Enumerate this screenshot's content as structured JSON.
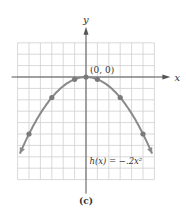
{
  "chart_data": {
    "type": "line",
    "title": "",
    "caption": "(c)",
    "xlabel": "x",
    "ylabel": "y",
    "xlim": [
      -6,
      6
    ],
    "ylim": [
      -9,
      3
    ],
    "grid": true,
    "function_label": "h(x) = −.2x²",
    "origin_label": "(0, 0)",
    "series": [
      {
        "name": "h(x) = -.2x^2",
        "x": [
          -5,
          -3,
          -1,
          0,
          1,
          3,
          5
        ],
        "y": [
          -5,
          -1.8,
          -0.2,
          0,
          -0.2,
          -1.8,
          -5
        ],
        "marked_points": true
      }
    ],
    "curve_extent_x": [
      -5.8,
      5.8
    ]
  },
  "colors": {
    "grid": "#cfcfcf",
    "axis": "#555555",
    "curve": "#8a8a8a",
    "point": "#7a7a7a",
    "text": "#333333"
  }
}
